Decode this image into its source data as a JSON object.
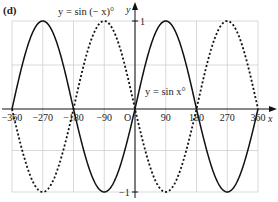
{
  "figure": {
    "panel_label": "(d)"
  },
  "chart_data": {
    "type": "line",
    "title": "",
    "panel_label": "(d)",
    "xlabel": "x",
    "ylabel": "y",
    "origin_label": "O",
    "xlim": [
      -360,
      360
    ],
    "ylim": [
      -1,
      1
    ],
    "grid": true,
    "x_ticks": [
      -360,
      -270,
      -180,
      -90,
      90,
      180,
      270,
      360
    ],
    "x_tick_labels": [
      "−360",
      "−270",
      "−180",
      "−90",
      "90",
      "180",
      "270",
      "360"
    ],
    "y_ticks": [
      1,
      -1
    ],
    "y_tick_labels": [
      "1",
      "−1"
    ],
    "x": [
      -360,
      -315,
      -270,
      -225,
      -180,
      -135,
      -90,
      -45,
      0,
      45,
      90,
      135,
      180,
      225,
      270,
      315,
      360
    ],
    "series": [
      {
        "name": "y = sin x°",
        "style": "solid",
        "values": [
          0,
          0.707,
          1,
          0.707,
          0,
          -0.707,
          -1,
          -0.707,
          0,
          0.707,
          1,
          0.707,
          0,
          -0.707,
          -1,
          -0.707,
          0
        ]
      },
      {
        "name": "y = sin (− x)°",
        "style": "dotted",
        "values": [
          0,
          -0.707,
          -1,
          -0.707,
          0,
          0.707,
          1,
          0.707,
          0,
          -0.707,
          -1,
          -0.707,
          0,
          0.707,
          1,
          0.707,
          0
        ]
      }
    ],
    "annotations": [
      {
        "text": "y = sin (− x)°",
        "near": "top, above dotted peak at x=-90"
      },
      {
        "text": "y = sin x°",
        "near": "right of origin, above x-axis"
      }
    ]
  }
}
